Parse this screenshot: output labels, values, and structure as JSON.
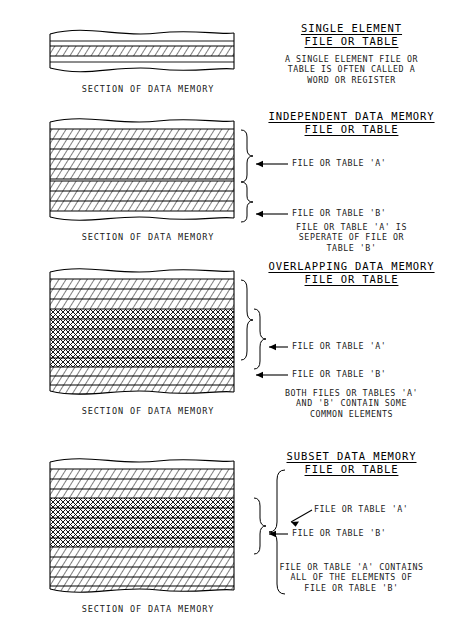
{
  "document": {
    "block_caption": "SECTION OF DATA MEMORY",
    "label_a": "FILE OR TABLE 'A'",
    "label_b": "FILE OR TABLE 'B'"
  },
  "sections": [
    {
      "id": "single-element",
      "title_line1": "SINGLE ELEMENT",
      "title_line2": "FILE OR TABLE",
      "desc": [
        "A SINGLE ELEMENT FILE OR",
        "TABLE IS OFTEN CALLED A",
        "WORD OR REGISTER"
      ],
      "caption": "SECTION OF DATA MEMORY",
      "rows_plain_top": 1,
      "rows_a": 1,
      "rows_overlap": 0,
      "rows_b": 0,
      "rows_plain_bottom": 1,
      "callouts": []
    },
    {
      "id": "independent",
      "title_line1": "INDEPENDENT DATA MEMORY",
      "title_line2": "FILE OR TABLE",
      "desc": [
        "FILE OR TABLE 'A' IS",
        "SEPERATE OF FILE OR",
        "TABLE 'B'"
      ],
      "caption": "SECTION OF DATA MEMORY",
      "rows_plain_top": 0,
      "rows_a": 5,
      "rows_overlap": 0,
      "rows_b": 3,
      "rows_plain_bottom": 0,
      "callouts": [
        {
          "text": "FILE OR TABLE 'A'"
        },
        {
          "text": "FILE OR TABLE 'B'"
        }
      ]
    },
    {
      "id": "overlapping",
      "title_line1": "OVERLAPPING DATA MEMORY",
      "title_line2": "FILE OR TABLE",
      "desc": [
        "BOTH FILES OR TABLES 'A'",
        "AND 'B' CONTAIN SOME",
        "COMMON ELEMENTS"
      ],
      "caption": "SECTION OF DATA MEMORY",
      "rows_plain_top": 0,
      "rows_a": 3,
      "rows_overlap": 6,
      "rows_b": 3,
      "rows_plain_bottom": 0,
      "callouts": [
        {
          "text": "FILE OR TABLE 'A'"
        },
        {
          "text": "FILE OR TABLE 'B'"
        }
      ]
    },
    {
      "id": "subset",
      "title_line1": "SUBSET DATA MEMORY",
      "title_line2": "FILE OR TABLE",
      "desc": [
        "FILE OR TABLE 'A' CONTAINS",
        "ALL OF THE ELEMENTS OF",
        "FILE OR TABLE 'B'"
      ],
      "caption": "SECTION OF DATA MEMORY",
      "rows_plain_top": 0,
      "rows_a": 3,
      "rows_overlap": 5,
      "rows_b": 0,
      "rows_plain_bottom": 4,
      "callouts": [
        {
          "text": "FILE OR TABLE 'A'"
        },
        {
          "text": "FILE OR TABLE 'B'"
        }
      ]
    }
  ]
}
